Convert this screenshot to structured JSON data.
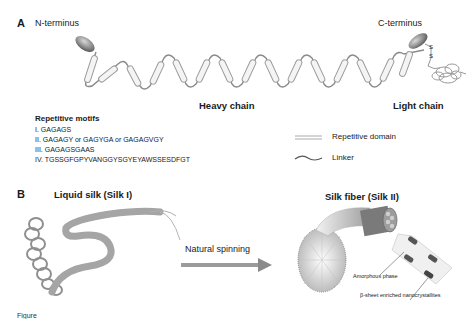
{
  "panel_a": {
    "label": "A",
    "n_terminus": "N-terminus",
    "c_terminus": "C-terminus",
    "heavy_chain": "Heavy chain",
    "light_chain": "Light chain",
    "disulfide": [
      "S",
      "S"
    ],
    "motifs": {
      "title": "Repetitive motifs",
      "items": [
        "I.  GAGAGS",
        "II.  GAGAGY or GAGYGA or GAGAGVGY",
        "III. GAGAGSGAAS",
        "IV. TGSSGFGPYVANGGYSGYEYAWSSESDFGT"
      ]
    },
    "legend": [
      {
        "label": "Repetitive domain",
        "icon": "double-line-icon"
      },
      {
        "label": "Linker",
        "icon": "wave-line-icon"
      }
    ]
  },
  "panel_b": {
    "label": "B",
    "liquid_silk": "Liquid silk (Silk I)",
    "process": "Natural spinning",
    "silk_fiber": "Silk fiber (Silk II)",
    "amorphous": "Amorphous phase",
    "beta_sheet": "β-sheet enriched nanocrystallites"
  },
  "caption": "Figure"
}
